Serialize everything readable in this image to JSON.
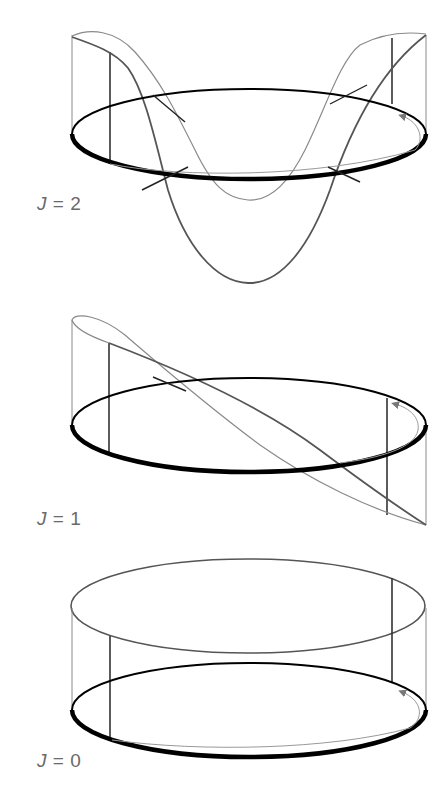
{
  "figure": {
    "panels": [
      {
        "id": "j2",
        "label_var": "J",
        "label_eq": " = ",
        "label_val": "2",
        "description": "Cylinder with two-fold wave (two crossings on each side, arrow on ring)"
      },
      {
        "id": "j1",
        "label_var": "J",
        "label_eq": " = ",
        "label_val": "1",
        "description": "Cylinder with tilted single-winding curve"
      },
      {
        "id": "j0",
        "label_var": "J",
        "label_eq": " = ",
        "label_val": "0",
        "description": "Flat cylinder, top ring parallel to bottom ring"
      }
    ],
    "colors": {
      "ring": "#000000",
      "dark_curve": "#555555",
      "light_curve": "#8a8a8a",
      "label": "#6a6a6a",
      "background": "#ffffff"
    }
  }
}
